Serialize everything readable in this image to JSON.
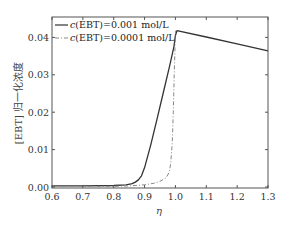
{
  "chart_data": {
    "type": "line",
    "title": "",
    "xlabel": "η",
    "ylabel": "[EBT] 归一化浓度",
    "xlim": [
      0.6,
      1.3
    ],
    "ylim": [
      0.0,
      0.0456
    ],
    "xticks": [
      0.6,
      0.7,
      0.8,
      0.9,
      1.0,
      1.1,
      1.2,
      1.3
    ],
    "xtick_labels": [
      "0.6",
      "0.7",
      "0.8",
      "0.9",
      "1.0",
      "1.1",
      "1.2",
      "1.3"
    ],
    "yticks": [
      0.0,
      0.01,
      0.02,
      0.03,
      0.04
    ],
    "ytick_labels": [
      "0.00",
      "0.01",
      "0.02",
      "0.03",
      "0.04"
    ],
    "grid": false,
    "legend_position": "upper left",
    "series": [
      {
        "name": "c(EBT)=0.001 mol/L",
        "style": "solid",
        "color": "#333333",
        "x": [
          0.6,
          0.7,
          0.8,
          0.84,
          0.86,
          0.87,
          0.88,
          0.89,
          0.9,
          0.92,
          0.94,
          0.96,
          0.98,
          0.995,
          1.0,
          1.005,
          1.1,
          1.2,
          1.3
        ],
        "y": [
          0.0003,
          0.0003,
          0.0004,
          0.0006,
          0.0009,
          0.0013,
          0.0019,
          0.003,
          0.0052,
          0.0112,
          0.018,
          0.025,
          0.032,
          0.0375,
          0.0405,
          0.0418,
          0.0401,
          0.0383,
          0.0364
        ]
      },
      {
        "name": "c(EBT)=0.0001 mol/L",
        "style": "dash-dot",
        "color": "#888888",
        "x": [
          0.6,
          0.7,
          0.8,
          0.85,
          0.9,
          0.93,
          0.95,
          0.97,
          0.98,
          0.985,
          0.99,
          0.993,
          0.996,
          0.999,
          1.0
        ],
        "y": [
          0.0002,
          0.0002,
          0.0002,
          0.0003,
          0.0006,
          0.001,
          0.0015,
          0.0025,
          0.004,
          0.0065,
          0.012,
          0.02,
          0.03,
          0.038,
          0.0418
        ]
      }
    ]
  },
  "legend": {
    "entries": [
      {
        "prefix": "c",
        "label": "(EBT)=0.001 mol/L"
      },
      {
        "prefix": "c",
        "label": "(EBT)=0.0001 mol/L"
      }
    ]
  },
  "axes": {
    "xlabel": "η",
    "ylabel": "[EBT] 归一化浓度"
  }
}
